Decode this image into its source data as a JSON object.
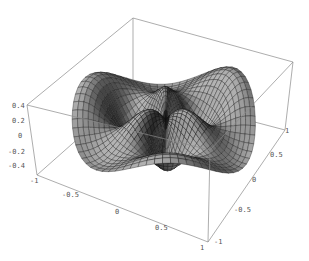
{
  "chart_data": {
    "type": "surface3d",
    "title": "",
    "x_axis": {
      "label": "",
      "range": [
        -1,
        1
      ],
      "ticks": [
        "-1",
        "-0.5",
        "0",
        "0.5",
        "1"
      ]
    },
    "y_axis": {
      "label": "",
      "range": [
        -1,
        1
      ],
      "ticks": [
        "-1",
        "-0.5",
        "0",
        "0.5",
        "1"
      ]
    },
    "z_axis": {
      "label": "",
      "range": [
        -0.4,
        0.4
      ],
      "ticks": [
        "0.4",
        "0.2",
        "0",
        "-0.2",
        "-0.4"
      ]
    },
    "domain": "unit disk x^2 + y^2 <= 1",
    "surface_style": {
      "mesh": true,
      "mesh_color": "#111111",
      "face_color": "#6a6a6a"
    },
    "box": true,
    "grid": false,
    "legend": null
  },
  "axes": {
    "x_ticks": [
      {
        "label": "-1",
        "x": 30,
        "y": 178
      },
      {
        "label": "-0.5",
        "x": 62,
        "y": 192
      },
      {
        "label": "0",
        "x": 115,
        "y": 209
      },
      {
        "label": "0.5",
        "x": 155,
        "y": 225
      },
      {
        "label": "1",
        "x": 200,
        "y": 245
      }
    ],
    "y_ticks": [
      {
        "label": "-1",
        "x": 214,
        "y": 239
      },
      {
        "label": "-0.5",
        "x": 234,
        "y": 207
      },
      {
        "label": "0",
        "x": 252,
        "y": 177
      },
      {
        "label": "0.5",
        "x": 270,
        "y": 152
      },
      {
        "label": "1",
        "x": 285,
        "y": 128
      }
    ],
    "z_ticks": [
      {
        "label": "0.4",
        "x": 12,
        "y": 103
      },
      {
        "label": "0.2",
        "x": 12,
        "y": 118
      },
      {
        "label": "0",
        "x": 18,
        "y": 133
      },
      {
        "label": "-0.2",
        "x": 8,
        "y": 149
      },
      {
        "label": "-0.4",
        "x": 8,
        "y": 163
      }
    ]
  }
}
